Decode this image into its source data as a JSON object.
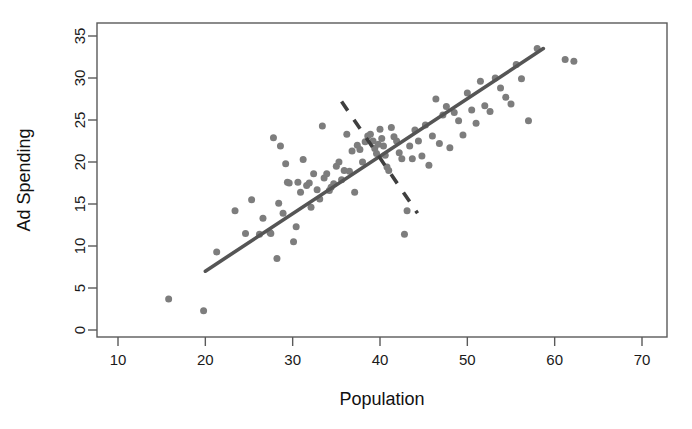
{
  "chart_data": {
    "type": "scatter",
    "title": "",
    "xlabel": "Population",
    "ylabel": "Ad Spending",
    "xlim": [
      6.0,
      71.4
    ],
    "ylim": [
      -0.8,
      36.4
    ],
    "xticks": [
      10,
      20,
      30,
      40,
      50,
      60,
      70
    ],
    "xtick_labels": [
      "10",
      "20",
      "30",
      "40",
      "50",
      "60",
      "70"
    ],
    "yticks": [
      0,
      5,
      10,
      15,
      20,
      25,
      30,
      35
    ],
    "ytick_labels": [
      "0",
      "5",
      "10",
      "15",
      "20",
      "25",
      "30",
      "35"
    ],
    "grid": false,
    "legend": null,
    "point_color": "#7d7d7d",
    "point_size": 7,
    "series": [
      {
        "name": "observations",
        "marker": "filled-circle",
        "x": [
          15.8,
          19.8,
          21.3,
          23.4,
          24.6,
          25.3,
          26.2,
          26.6,
          27.4,
          27.5,
          27.8,
          28.2,
          28.4,
          28.6,
          28.9,
          29.2,
          29.4,
          29.6,
          30.1,
          30.4,
          30.6,
          30.9,
          31.2,
          31.6,
          31.9,
          32.1,
          32.4,
          32.8,
          33.1,
          33.4,
          33.6,
          33.9,
          34.2,
          34.4,
          34.7,
          35.0,
          35.3,
          35.6,
          35.9,
          36.2,
          36.5,
          36.8,
          37.1,
          37.4,
          37.7,
          38.0,
          38.3,
          38.6,
          38.9,
          39.2,
          39.4,
          39.6,
          39.8,
          40.0,
          40.2,
          40.4,
          40.6,
          40.8,
          41.0,
          41.3,
          41.6,
          41.9,
          42.2,
          42.5,
          42.8,
          43.1,
          43.4,
          43.7,
          44.0,
          44.4,
          44.8,
          45.2,
          45.6,
          46.0,
          46.4,
          46.8,
          47.2,
          47.6,
          48.0,
          48.5,
          49.0,
          49.5,
          50.0,
          50.5,
          51.0,
          51.5,
          52.0,
          52.6,
          53.2,
          53.8,
          54.4,
          55.0,
          55.6,
          56.2,
          57.0,
          58.0,
          61.2,
          62.2
        ],
        "y": [
          3.7,
          2.3,
          9.3,
          14.2,
          11.5,
          15.5,
          11.4,
          13.3,
          11.6,
          11.5,
          22.9,
          8.5,
          15.1,
          21.9,
          13.9,
          19.8,
          17.6,
          17.5,
          10.5,
          12.3,
          17.6,
          16.4,
          20.3,
          17.2,
          17.5,
          14.6,
          18.6,
          16.7,
          15.6,
          24.3,
          18.1,
          18.6,
          16.6,
          17.0,
          17.4,
          19.5,
          20.0,
          17.9,
          19.0,
          23.3,
          18.9,
          21.3,
          16.4,
          22.0,
          21.5,
          20.0,
          22.4,
          23.1,
          23.3,
          22.5,
          21.6,
          21.0,
          22.1,
          23.9,
          22.8,
          21.9,
          20.8,
          19.4,
          19.0,
          24.1,
          23.0,
          22.5,
          21.1,
          20.4,
          11.4,
          14.2,
          21.9,
          20.4,
          23.8,
          22.5,
          20.7,
          24.4,
          19.6,
          23.1,
          27.5,
          22.2,
          25.6,
          26.6,
          21.7,
          25.9,
          24.9,
          23.2,
          28.2,
          26.2,
          24.6,
          29.6,
          26.7,
          26.0,
          30.0,
          28.8,
          27.7,
          26.9,
          31.6,
          29.9,
          24.9,
          33.5,
          32.2,
          32.0
        ]
      }
    ],
    "annotations": [
      {
        "name": "regression-line",
        "style": "solid",
        "color": "#555555",
        "x0": 20.0,
        "y0": 7.0,
        "x1": 58.7,
        "y1": 33.5
      },
      {
        "name": "perpendicular-dashed-line",
        "style": "dashed",
        "color": "#3f3f3f",
        "x0": 35.6,
        "y0": 27.2,
        "x1": 44.3,
        "y1": 13.9
      }
    ]
  }
}
